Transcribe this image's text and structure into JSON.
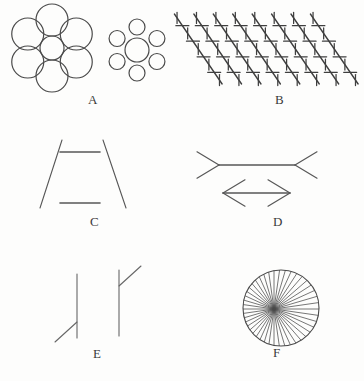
{
  "plate": {
    "title": "Classic geometric-optical illusion figures",
    "background_color": "#fdfdfc",
    "ink_color": "#4a4a4a",
    "width": 364,
    "height": 381
  },
  "panels": [
    {
      "id": "A",
      "label": "A",
      "name": "ebbinghaus-illusion",
      "description": "Two central circles of equal size, one ringed by six large circles and one ringed by six small circles",
      "left_cluster": {
        "center_circle": {
          "cx": 52,
          "cy": 48,
          "r": 12
        },
        "surround_count": 6,
        "surround_radius": 16,
        "surround_distance": 28
      },
      "right_cluster": {
        "center_circle": {
          "cx": 137,
          "cy": 50,
          "r": 12
        },
        "surround_count": 6,
        "surround_radius": 8,
        "surround_distance": 23
      }
    },
    {
      "id": "B",
      "label": "B",
      "name": "zollner-illusion",
      "description": "Parallel oblique lines crossed by alternating short hatch marks so they appear non-parallel",
      "long_line_count": 8,
      "hatch_per_line": 9
    },
    {
      "id": "C",
      "label": "C",
      "name": "ponzo-illusion",
      "description": "Two equal horizontal bars between converging oblique rails; the upper bar looks longer",
      "bars": [
        {
          "x1": 60,
          "y1": 152,
          "x2": 100,
          "y2": 152
        },
        {
          "x1": 60,
          "y1": 203,
          "x2": 100,
          "y2": 203
        }
      ]
    },
    {
      "id": "D",
      "label": "D",
      "name": "muller-lyer-illusion",
      "description": "Two equal shafts, one with outward fins and one with inward arrowheads",
      "shafts": [
        {
          "x1": 219,
          "y1": 165,
          "x2": 295,
          "y2": 165,
          "fins": "outward"
        },
        {
          "x1": 223,
          "y1": 193,
          "x2": 290,
          "y2": 193,
          "fins": "inward"
        }
      ]
    },
    {
      "id": "E",
      "label": "E",
      "name": "judd-illusion",
      "description": "Two equal vertical lines, one with an oblique at the foot and one with an oblique at the head",
      "verticals": [
        {
          "x": 77,
          "y1": 274,
          "y2": 338,
          "oblique": "bottom-left"
        },
        {
          "x": 119,
          "y1": 270,
          "y2": 336,
          "oblique": "top-right"
        }
      ]
    },
    {
      "id": "F",
      "label": "F",
      "name": "radiating-lines-illusion",
      "description": "A circle filled with dense lines radiating from an off-centre point",
      "circle": {
        "cx": 281,
        "cy": 308,
        "r": 38
      },
      "ray_count": 44,
      "hub": {
        "cx": 274,
        "cy": 309
      }
    }
  ]
}
